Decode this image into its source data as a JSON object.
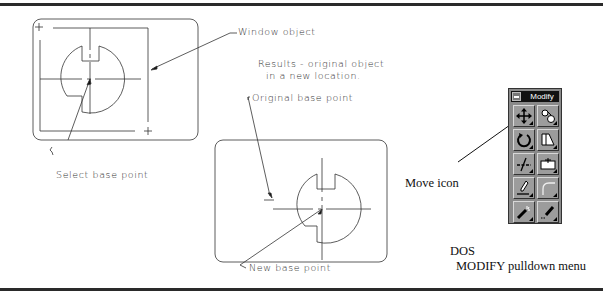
{
  "figure": {
    "labels": {
      "window_object": "Window object",
      "results_line1": "Results - original object",
      "results_line2": "in a new location.",
      "original_base_point": "Original base point",
      "select_base_point": "Select base point",
      "new_base_point": "New base point",
      "move_icon": "Move icon"
    },
    "caption": {
      "line1": "DOS",
      "line2": "MODIFY pulldown menu"
    }
  },
  "toolbar": {
    "title": "Modify",
    "buttons": [
      {
        "name": "move",
        "icon": "move-icon"
      },
      {
        "name": "copy",
        "icon": "copy-object-icon"
      },
      {
        "name": "rotate",
        "icon": "rotate-icon"
      },
      {
        "name": "stretch",
        "icon": "stretch-icon"
      },
      {
        "name": "trim",
        "icon": "trim-icon"
      },
      {
        "name": "break",
        "icon": "break-icon"
      },
      {
        "name": "edit",
        "icon": "edit-pencil-icon"
      },
      {
        "name": "fillet",
        "icon": "fillet-icon"
      },
      {
        "name": "explode",
        "icon": "explode-icon"
      },
      {
        "name": "erase",
        "icon": "erase-icon"
      }
    ]
  },
  "colors": {
    "line": "#333333",
    "toolbar_bg": "#8a8a8a",
    "title_bar": "#111111"
  }
}
